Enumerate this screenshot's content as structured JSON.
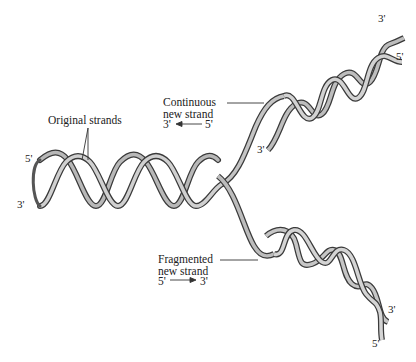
{
  "diagram": {
    "labels": {
      "original_strands": "Original strands",
      "continuous_line1": "Continuous",
      "continuous_line2": "new strand",
      "continuous_from": "3'",
      "continuous_to": "5'",
      "fragmented_line1": "Fragmented",
      "fragmented_line2": "new strand",
      "fragmented_from": "5'",
      "fragmented_to": "3'"
    },
    "ends": {
      "parent_top": "5'",
      "parent_bottom": "3'",
      "upper_top": "3'",
      "upper_right": "5'",
      "upper_inner": "3'",
      "lower_right": "3'",
      "lower_bottom": "5'"
    },
    "colors": {
      "ribbon_light": "#c8c8c8",
      "ribbon_mid": "#8a8a8a",
      "ribbon_dark": "#3a3a3a",
      "text": "#222222",
      "leader_line": "#333333"
    }
  }
}
